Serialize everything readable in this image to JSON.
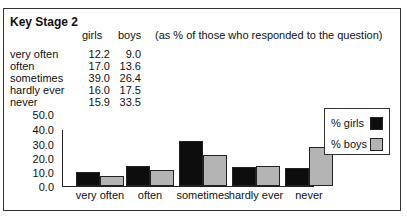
{
  "title": "Key Stage 2",
  "table": {
    "headers": {
      "girls": "girls",
      "boys": "boys"
    },
    "note": "(as % of those who responded to the question)",
    "rows": [
      {
        "label": "very often",
        "girls": "12.2",
        "boys": "9.0"
      },
      {
        "label": "often",
        "girls": "17.0",
        "boys": "13.6"
      },
      {
        "label": "sometimes",
        "girls": "39.0",
        "boys": "26.4"
      },
      {
        "label": "hardly ever",
        "girls": "16.0",
        "boys": "17.5"
      },
      {
        "label": "never",
        "girls": "15.9",
        "boys": "33.5"
      }
    ]
  },
  "legend": {
    "girls": "% girls",
    "boys": "% boys"
  },
  "colors": {
    "girls": "#0d0d0d",
    "boys": "#b4b4b4"
  },
  "chart_data": {
    "type": "bar",
    "title": "Key Stage 2",
    "subtitle": "(as % of those who responded to the question)",
    "categories": [
      "very often",
      "often",
      "sometimes",
      "hardly ever",
      "never"
    ],
    "series": [
      {
        "name": "% girls",
        "values": [
          12.2,
          17.0,
          39.0,
          16.0,
          15.9
        ]
      },
      {
        "name": "% boys",
        "values": [
          9.0,
          13.6,
          26.4,
          17.5,
          33.5
        ]
      }
    ],
    "xlabel": "",
    "ylabel": "",
    "ylim": [
      0,
      50
    ],
    "yticks": [
      "0.0",
      "10.0",
      "20.0",
      "30.0",
      "40.0",
      "50.0"
    ],
    "grid": false,
    "legend_position": "right"
  }
}
